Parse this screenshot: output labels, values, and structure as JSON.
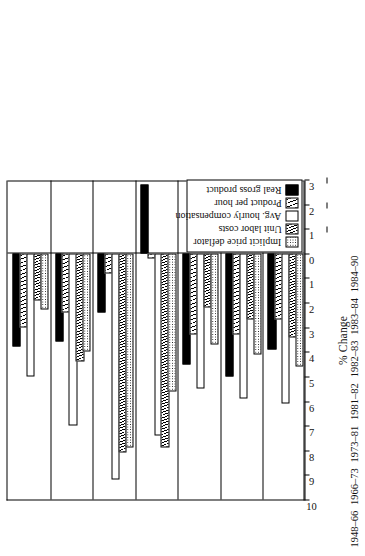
{
  "chart_data": {
    "type": "bar",
    "orientation": "horizontal",
    "title": "",
    "xlabel": "",
    "ylabel": "% Change",
    "ylim": [
      10,
      -3
    ],
    "grid": false,
    "legend_position": "bottom-right",
    "tick_labels": [
      "10",
      "9",
      "8",
      "7",
      "6",
      "5",
      "4",
      "3",
      "2",
      "1",
      "0",
      "−1",
      "−2",
      "−3"
    ],
    "tick_values": [
      10,
      9,
      8,
      7,
      6,
      5,
      4,
      3,
      2,
      1,
      0,
      -1,
      -2,
      -3
    ],
    "categories": [
      "1948–66",
      "1966–73",
      "1973–81",
      "1981–82",
      "1982–83",
      "1983–84",
      "1984–90"
    ],
    "series": [
      {
        "name": "Real gross product",
        "pattern": "solid",
        "values": [
          3.8,
          3.6,
          2.4,
          -2.8,
          4.5,
          5.0,
          3.9
        ]
      },
      {
        "name": "Product per hour",
        "pattern": "hatch",
        "values": [
          3.0,
          2.4,
          0.8,
          0.2,
          3.3,
          3.3,
          2.7
        ]
      },
      {
        "name": "Avg. hourly compensation",
        "pattern": "open",
        "values": [
          5.0,
          7.0,
          9.2,
          7.4,
          5.5,
          5.9,
          6.1
        ]
      },
      {
        "name": "Unit labor costs",
        "pattern": "hatch-dense",
        "values": [
          1.9,
          4.4,
          8.1,
          7.9,
          2.2,
          2.7,
          3.4
        ]
      },
      {
        "name": "Implicit price deflator",
        "pattern": "dot",
        "values": [
          2.3,
          4.0,
          7.9,
          5.6,
          3.7,
          4.1,
          4.6
        ]
      }
    ],
    "annotations": [
      {
        "label": "Actual",
        "spans": [
          "1948–66",
          "1966–73",
          "1973–81",
          "1981–82"
        ]
      },
      {
        "label": "Projected",
        "spans": [
          "1982–83",
          "1983–84",
          "1984–90"
        ]
      }
    ]
  },
  "legend": {
    "items": [
      {
        "label": "Real gross product"
      },
      {
        "label": "Product per hour"
      },
      {
        "label": "Avg. hourly compensation"
      },
      {
        "label": "Unit labor costs"
      },
      {
        "label": "Implicit price deflator"
      }
    ]
  },
  "axis": {
    "title": "% Change"
  },
  "colors": {
    "ink": "#000000",
    "paper": "#ffffff"
  }
}
